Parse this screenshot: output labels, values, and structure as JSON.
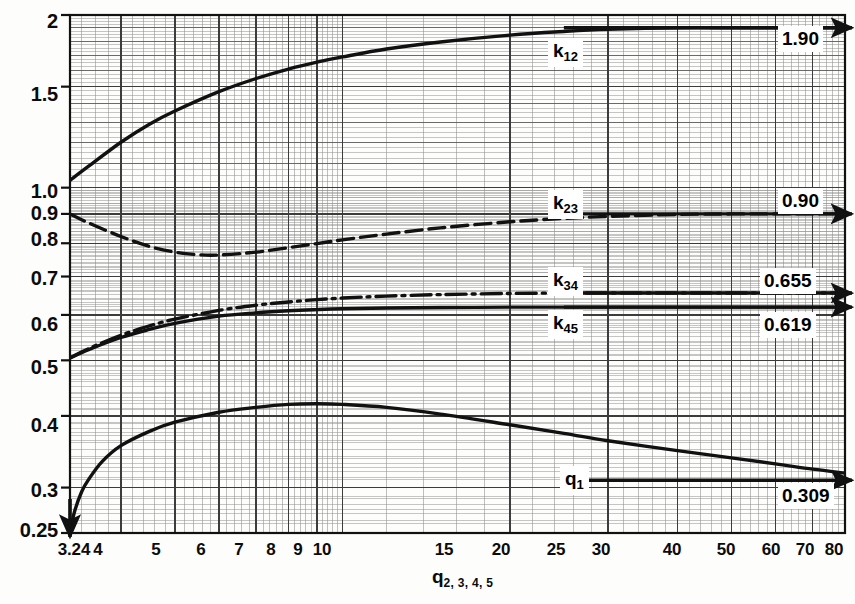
{
  "chart_data": {
    "type": "line",
    "title": "",
    "xlabel": "q 2, 3, 4, 5",
    "ylabel": "",
    "xscale": "log",
    "yscale": "log",
    "xlim": [
      3.24,
      80
    ],
    "ylim": [
      0.25,
      2.0
    ],
    "grid": true,
    "grid_style": "log-log graph paper, major decade lines plus minor divisions",
    "legend": "inline curve labels with asymptote callout boxes at right edge",
    "xticks": [
      "3.24",
      "4",
      "5",
      "6",
      "7",
      "8",
      "9",
      "10",
      "15",
      "20",
      "25",
      "30",
      "40",
      "50",
      "60",
      "70",
      "80"
    ],
    "xtick_values": [
      3.24,
      4,
      5,
      6,
      7,
      8,
      9,
      10,
      15,
      20,
      25,
      30,
      40,
      50,
      60,
      70,
      80
    ],
    "yticks": [
      "0.25",
      "0.3",
      "0.4",
      "0.5",
      "0.6",
      "0.7",
      "0.8",
      "0.9",
      "1.0",
      "1.5",
      "2"
    ],
    "ytick_values": [
      0.25,
      0.3,
      0.4,
      0.5,
      0.6,
      0.7,
      0.8,
      0.9,
      1.0,
      1.5,
      2.0
    ],
    "series": [
      {
        "name": "k12",
        "label": "k",
        "label_sub": "12",
        "linestyle": "solid",
        "asymptote": 1.9,
        "asymptote_label": "1.90",
        "x": [
          3.24,
          3.5,
          4,
          4.5,
          5,
          6,
          7,
          8,
          9,
          10,
          12,
          15,
          20,
          25,
          30,
          40,
          50,
          60,
          70,
          80
        ],
        "y": [
          1.03,
          1.09,
          1.2,
          1.29,
          1.36,
          1.47,
          1.55,
          1.61,
          1.655,
          1.69,
          1.745,
          1.795,
          1.845,
          1.872,
          1.888,
          1.9,
          1.9,
          1.9,
          1.9,
          1.9
        ]
      },
      {
        "name": "k23",
        "label": "k",
        "label_sub": "23",
        "linestyle": "dashed",
        "asymptote": 0.9,
        "asymptote_label": "0.90",
        "x": [
          3.24,
          3.5,
          4,
          4.5,
          5,
          5.5,
          6,
          7,
          8,
          9,
          10,
          12,
          15,
          20,
          25,
          30,
          40,
          50,
          60,
          70,
          80
        ],
        "y": [
          0.9,
          0.868,
          0.822,
          0.79,
          0.772,
          0.764,
          0.763,
          0.772,
          0.786,
          0.799,
          0.811,
          0.83,
          0.851,
          0.872,
          0.884,
          0.891,
          0.898,
          0.9,
          0.9,
          0.9,
          0.9
        ]
      },
      {
        "name": "k34",
        "label": "k",
        "label_sub": "34",
        "linestyle": "dashdot",
        "asymptote": 0.655,
        "asymptote_label": "0.655",
        "x": [
          3.24,
          3.5,
          4,
          4.5,
          5,
          6,
          7,
          8,
          9,
          10,
          12,
          15,
          20,
          25,
          30,
          40,
          50,
          60,
          70,
          80
        ],
        "y": [
          0.505,
          0.524,
          0.553,
          0.574,
          0.59,
          0.611,
          0.624,
          0.632,
          0.638,
          0.642,
          0.647,
          0.651,
          0.654,
          0.655,
          0.655,
          0.655,
          0.655,
          0.655,
          0.655,
          0.655
        ]
      },
      {
        "name": "k45",
        "label": "k",
        "label_sub": "45",
        "linestyle": "solid",
        "asymptote": 0.619,
        "asymptote_label": "0.619",
        "x": [
          3.24,
          3.5,
          4,
          4.5,
          5,
          6,
          7,
          8,
          9,
          10,
          12,
          15,
          20,
          25,
          30,
          40,
          50,
          60,
          70,
          80
        ],
        "y": [
          0.505,
          0.522,
          0.548,
          0.566,
          0.58,
          0.597,
          0.605,
          0.61,
          0.613,
          0.615,
          0.617,
          0.618,
          0.619,
          0.619,
          0.619,
          0.619,
          0.619,
          0.619,
          0.619,
          0.619
        ]
      },
      {
        "name": "q1",
        "label": "q",
        "label_sub": "1",
        "linestyle": "solid",
        "asymptote": 0.309,
        "asymptote_label": "0.309",
        "x": [
          3.24,
          3.3,
          3.4,
          3.5,
          3.7,
          4,
          4.5,
          5,
          6,
          7,
          8,
          9,
          10,
          12,
          15,
          20,
          25,
          30,
          40,
          50,
          60,
          70,
          80
        ],
        "y": [
          0.25,
          0.272,
          0.295,
          0.31,
          0.333,
          0.355,
          0.376,
          0.39,
          0.406,
          0.414,
          0.419,
          0.42,
          0.419,
          0.414,
          0.403,
          0.386,
          0.373,
          0.362,
          0.348,
          0.338,
          0.33,
          0.323,
          0.318
        ]
      }
    ],
    "annotations": [
      {
        "text": "1.90",
        "kind": "asymptote-value",
        "series": "k12"
      },
      {
        "text": "0.90",
        "kind": "asymptote-value",
        "series": "k23"
      },
      {
        "text": "0.655",
        "kind": "asymptote-value",
        "series": "k34"
      },
      {
        "text": "0.619",
        "kind": "asymptote-value",
        "series": "k45"
      },
      {
        "text": "0.309",
        "kind": "asymptote-value",
        "series": "q1"
      }
    ]
  },
  "axis": {
    "x_title_main": "q",
    "x_title_sub": "2, 3, 4, 5",
    "y_tick_labels": [
      "2",
      "1.5",
      "1.0",
      "0.9",
      "0.8",
      "0.7",
      "0.6",
      "0.5",
      "0.4",
      "0.3",
      "0.25"
    ],
    "x_tick_labels": [
      "3.24",
      "4",
      "5",
      "6",
      "7",
      "8",
      "9",
      "10",
      "15",
      "20",
      "25",
      "30",
      "40",
      "50",
      "60",
      "70",
      "80"
    ]
  },
  "curve_tags": {
    "k12": {
      "main": "k",
      "sub": "12"
    },
    "k23": {
      "main": "k",
      "sub": "23"
    },
    "k34": {
      "main": "k",
      "sub": "34"
    },
    "k45": {
      "main": "k",
      "sub": "45"
    },
    "q1": {
      "main": "q",
      "sub": "1"
    }
  },
  "value_tags": {
    "k12": "1.90",
    "k23": "0.90",
    "k34": "0.655",
    "k45": "0.619",
    "q1": "0.309"
  },
  "colors": {
    "ink": "#111111",
    "grid_major": "#3c3c3c",
    "grid_minor": "#8d8d8d",
    "paper": "#fdfdfb"
  }
}
